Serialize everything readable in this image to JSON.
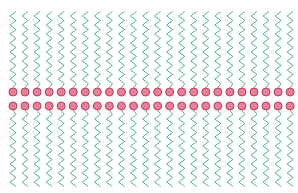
{
  "layout": {
    "width": 298,
    "height": 193,
    "count_per_row": 24,
    "first_x": 13,
    "spacing": 12.05,
    "top_head_y": 92,
    "bottom_head_y": 106,
    "head_radius": 4,
    "top_tail_end_y": 10,
    "bottom_tail_end_y": 188,
    "tail_amplitude": 3,
    "tail_period": 9
  },
  "colors": {
    "head_fill": "#e88197",
    "head_stroke": "#c23a5a",
    "tail": "#4fb583",
    "background": "#ffffff"
  },
  "leaflets": [
    {
      "name": "outer-leaflet",
      "direction": "up"
    },
    {
      "name": "inner-leaflet",
      "direction": "down"
    }
  ]
}
